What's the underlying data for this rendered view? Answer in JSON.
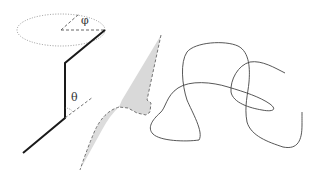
{
  "diagram": {
    "labels": {
      "phi": "φ",
      "theta": "θ"
    },
    "colors": {
      "bond": "#1a1a1a",
      "dashed": "#555555",
      "dotted_ellipse": "#888888",
      "shade": "#d8d8d8",
      "coil": "#444444"
    },
    "panels": [
      {
        "name": "bond-angle-schematic",
        "angles": [
          "φ",
          "θ"
        ]
      },
      {
        "name": "swept-surface"
      },
      {
        "name": "random-coil"
      }
    ]
  }
}
